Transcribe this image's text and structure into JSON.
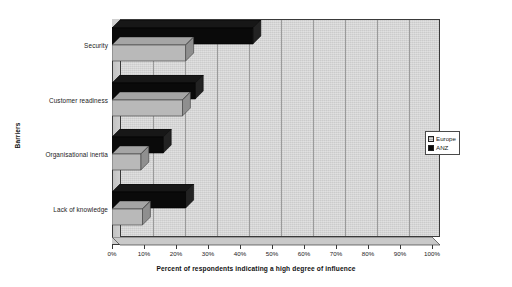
{
  "chart_data": {
    "type": "bar",
    "orientation": "horizontal",
    "title": "",
    "xlabel": "Percent of respondents indicating a high degree of influence",
    "ylabel": "Barriers",
    "categories": [
      "Security",
      "Customer readiness",
      "Organisational inertia",
      "Lack of knowledge"
    ],
    "series": [
      {
        "name": "Europe",
        "color": "#b9b9b9",
        "values": [
          23,
          22,
          9,
          9.5
        ]
      },
      {
        "name": "ANZ",
        "color": "#0a0a0a",
        "values": [
          44,
          26,
          16,
          23
        ]
      }
    ],
    "xlim": [
      0,
      100
    ],
    "xtick_labels": [
      "0%",
      "10%",
      "20%",
      "30%",
      "40%",
      "50%",
      "60%",
      "70%",
      "80%",
      "90%",
      "100%"
    ],
    "xtick_values": [
      0,
      10,
      20,
      30,
      40,
      50,
      60,
      70,
      80,
      90,
      100
    ],
    "grid": true,
    "legend_position": "right",
    "style": "3d-bar"
  },
  "legend": {
    "entries": [
      {
        "label": "Europe",
        "color": "#b9b9b9"
      },
      {
        "label": "ANZ",
        "color": "#0a0a0a"
      }
    ]
  },
  "colors": {
    "plot_background": "#d4d4d4",
    "axis": "#3a3a3a",
    "gridline": "#9a9a9a",
    "europe": "#b9b9b9",
    "anz": "#0a0a0a"
  }
}
